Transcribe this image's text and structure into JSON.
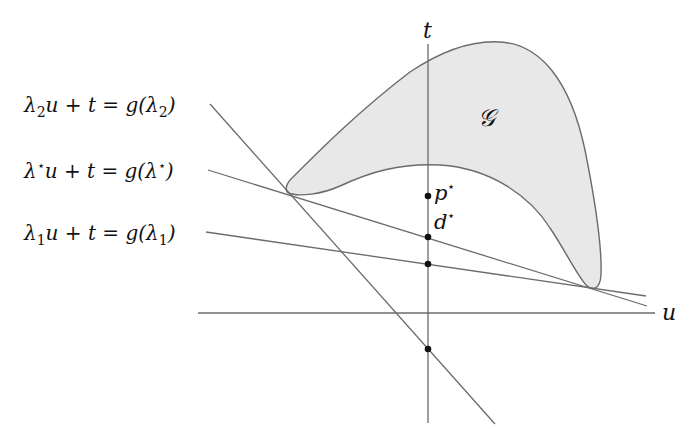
{
  "diagram": {
    "axes": {
      "t_label": "t",
      "u_label": "u"
    },
    "region": {
      "label": "𝒢",
      "fill": "#e8e8e8",
      "stroke": "#6b6b6b"
    },
    "lines": [
      {
        "id": "lambda2",
        "label_parts": [
          "λ",
          "2",
          "u + t = g(λ",
          "2",
          ")"
        ],
        "label_text": "λ₂u + t = g(λ₂)"
      },
      {
        "id": "lambda_star",
        "label_parts": [
          "λ",
          "⋆",
          "u + t = g(λ",
          "⋆",
          ")"
        ],
        "label_text": "λ⋆u + t = g(λ⋆)"
      },
      {
        "id": "lambda1",
        "label_parts": [
          "λ",
          "1",
          "u + t = g(λ",
          "1",
          ")"
        ],
        "label_text": "λ₁u + t = g(λ₁)"
      }
    ],
    "points": {
      "p_star": {
        "label": "p",
        "sup": "⋆"
      },
      "d_star": {
        "label": "d",
        "sup": "⋆"
      }
    }
  }
}
